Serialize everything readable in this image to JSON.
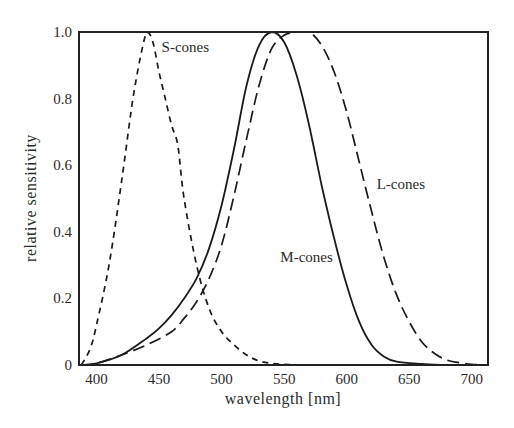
{
  "chart_data": {
    "type": "line",
    "title": "",
    "xlabel": "wavelength [nm]",
    "ylabel": "relative sensitivity",
    "xlim": [
      386,
      713
    ],
    "ylim": [
      0,
      1.0
    ],
    "grid": false,
    "legend": "inline labels",
    "x_ticks": [
      400,
      450,
      500,
      550,
      600,
      650,
      700
    ],
    "y_ticks": [
      {
        "value": 0,
        "label": "0"
      },
      {
        "value": 0.2,
        "label": "0.2"
      },
      {
        "value": 0.4,
        "label": "0.4"
      },
      {
        "value": 0.6,
        "label": "0.6"
      },
      {
        "value": 0.8,
        "label": "0.8"
      },
      {
        "value": 1.0,
        "label": "1.0"
      }
    ],
    "series": [
      {
        "name": "S-cones",
        "style": "short-dash",
        "label_pos": {
          "x": 452,
          "y": 0.94
        },
        "x": [
          388,
          395,
          400,
          410,
          420,
          430,
          440,
          445,
          450,
          455,
          460,
          465,
          470,
          480,
          490,
          500,
          510,
          520,
          530,
          540,
          550,
          560
        ],
        "values": [
          0.0,
          0.05,
          0.12,
          0.3,
          0.55,
          0.82,
          1.0,
          0.97,
          0.88,
          0.8,
          0.72,
          0.66,
          0.5,
          0.3,
          0.17,
          0.1,
          0.06,
          0.03,
          0.012,
          0.005,
          0.002,
          0.0
        ]
      },
      {
        "name": "M-cones",
        "style": "solid",
        "label_pos": {
          "x": 547,
          "y": 0.31
        },
        "x": [
          388,
          400,
          420,
          440,
          450,
          460,
          470,
          480,
          490,
          500,
          510,
          520,
          530,
          540,
          550,
          560,
          570,
          580,
          590,
          600,
          610,
          620,
          630,
          640,
          660,
          680
        ],
        "values": [
          0.0,
          0.005,
          0.03,
          0.08,
          0.11,
          0.15,
          0.2,
          0.26,
          0.35,
          0.48,
          0.65,
          0.84,
          0.96,
          1.0,
          0.97,
          0.87,
          0.72,
          0.54,
          0.38,
          0.24,
          0.13,
          0.06,
          0.025,
          0.01,
          0.003,
          0.0
        ]
      },
      {
        "name": "L-cones",
        "style": "long-dash",
        "label_pos": {
          "x": 624,
          "y": 0.53
        },
        "x": [
          388,
          400,
          420,
          440,
          460,
          470,
          480,
          490,
          500,
          510,
          520,
          530,
          540,
          550,
          560,
          570,
          580,
          590,
          600,
          610,
          620,
          630,
          640,
          650,
          660,
          670,
          680,
          690,
          700,
          710
        ],
        "values": [
          0.0,
          0.005,
          0.03,
          0.06,
          0.1,
          0.14,
          0.19,
          0.26,
          0.36,
          0.51,
          0.68,
          0.84,
          0.95,
          0.99,
          1.0,
          1.0,
          0.96,
          0.88,
          0.76,
          0.61,
          0.46,
          0.32,
          0.21,
          0.13,
          0.07,
          0.035,
          0.015,
          0.007,
          0.002,
          0.0
        ]
      }
    ]
  }
}
